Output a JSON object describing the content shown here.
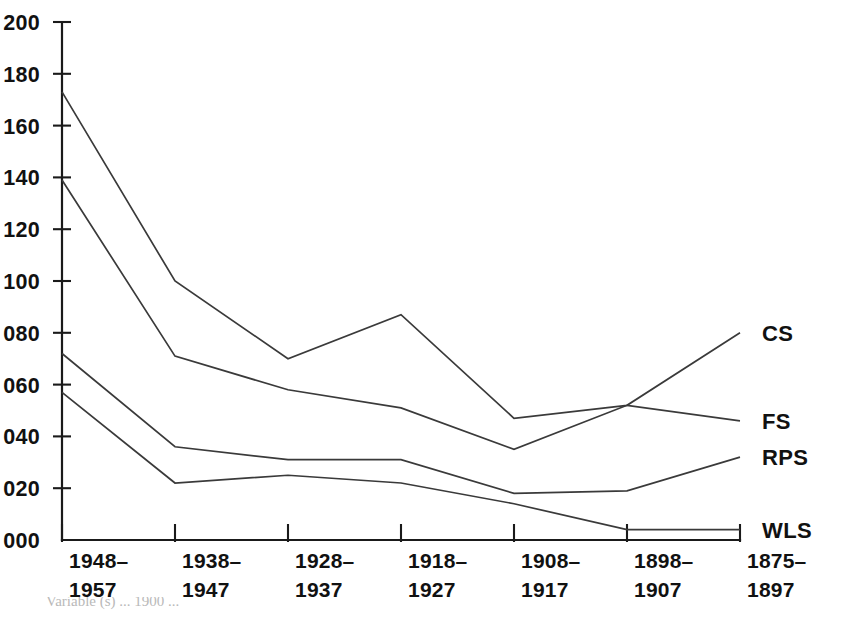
{
  "chart_data": {
    "type": "line",
    "title": "",
    "xlabel": "",
    "ylabel": "",
    "ylim": [
      0,
      200
    ],
    "grid": false,
    "legend_position": "right-inline",
    "categories": [
      "1948–1957",
      "1938–1947",
      "1928–1937",
      "1918–1927",
      "1908–1917",
      "1898–1907",
      "1875–1897"
    ],
    "category_lines": [
      {
        "top": "1948–",
        "bottom": "1957"
      },
      {
        "top": "1938–",
        "bottom": "1947"
      },
      {
        "top": "1928–",
        "bottom": "1937"
      },
      {
        "top": "1918–",
        "bottom": "1927"
      },
      {
        "top": "1908–",
        "bottom": "1917"
      },
      {
        "top": "1898–",
        "bottom": "1907"
      },
      {
        "top": "1875–",
        "bottom": "1897"
      }
    ],
    "ytick_labels": [
      "000",
      "020",
      "040",
      "060",
      "080",
      "100",
      "120",
      "140",
      "160",
      "180",
      "200"
    ],
    "ytick_values": [
      0,
      20,
      40,
      60,
      80,
      100,
      120,
      140,
      160,
      180,
      200
    ],
    "series": [
      {
        "name": "CS",
        "values": [
          173,
          100,
          70,
          87,
          47,
          52,
          80
        ]
      },
      {
        "name": "FS",
        "values": [
          139,
          71,
          58,
          51,
          35,
          52,
          46
        ]
      },
      {
        "name": "RPS",
        "values": [
          72,
          36,
          31,
          31,
          18,
          19,
          32
        ]
      },
      {
        "name": "WLS",
        "values": [
          57,
          22,
          25,
          22,
          14,
          4,
          4
        ]
      }
    ],
    "colors": {
      "line": "#3a3a3a",
      "axis": "#1a1a1a",
      "text": "#111111",
      "background": "#ffffff"
    }
  },
  "caption": {
    "text": "Variable (s) ... 1900 ..."
  }
}
